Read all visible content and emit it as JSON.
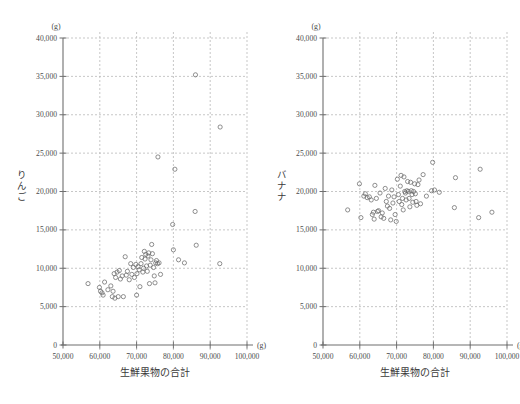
{
  "figure": {
    "background_color": "#ffffff",
    "marker_color": "#6b6b6b",
    "grid_color": "#b9b9b9",
    "axis_color": "#6f6f6f"
  },
  "charts": [
    {
      "id": "apple-scatter",
      "name": "scatter-chart-apple",
      "type": "scatter",
      "title": "",
      "xlabel": "生鮮果物の合計",
      "ylabel": "りんご",
      "ylabel_chars": [
        "り",
        "ん",
        "ご"
      ],
      "x_unit": "(g)",
      "y_unit": "(g)",
      "xlim": [
        50000,
        100000
      ],
      "ylim": [
        0,
        40000
      ],
      "x_ticks": [
        50000,
        60000,
        70000,
        80000,
        90000,
        100000
      ],
      "x_tick_labels": [
        "50,000",
        "60,000",
        "70,000",
        "80,000",
        "90,000",
        "100,000"
      ],
      "y_ticks": [
        0,
        5000,
        10000,
        15000,
        20000,
        25000,
        30000,
        35000,
        40000
      ],
      "y_tick_labels": [
        "0",
        "5,000",
        "10,000",
        "15,000",
        "20,000",
        "25,000",
        "30,000",
        "35,000",
        "40,000"
      ],
      "grid": true,
      "grid_x": [
        60000,
        70000,
        80000,
        90000,
        100000
      ],
      "grid_y": [
        5000,
        10000,
        15000,
        20000,
        25000,
        30000,
        35000,
        40000
      ],
      "legend": "none",
      "points": [
        [
          56800,
          8000
        ],
        [
          59900,
          7500
        ],
        [
          60200,
          7000
        ],
        [
          60600,
          6800
        ],
        [
          60900,
          6500
        ],
        [
          61300,
          8200
        ],
        [
          62200,
          7200
        ],
        [
          63000,
          7700
        ],
        [
          63400,
          6300
        ],
        [
          63600,
          7000
        ],
        [
          63900,
          9300
        ],
        [
          64100,
          6100
        ],
        [
          64300,
          8800
        ],
        [
          64700,
          9500
        ],
        [
          65000,
          6300
        ],
        [
          65300,
          9700
        ],
        [
          65600,
          8600
        ],
        [
          66100,
          9000
        ],
        [
          66400,
          6300
        ],
        [
          66900,
          11500
        ],
        [
          67200,
          9100
        ],
        [
          67500,
          9600
        ],
        [
          68000,
          8500
        ],
        [
          68400,
          10600
        ],
        [
          68700,
          9200
        ],
        [
          69100,
          10100
        ],
        [
          69400,
          8800
        ],
        [
          69800,
          10500
        ],
        [
          70000,
          6500
        ],
        [
          70100,
          9300
        ],
        [
          70400,
          10200
        ],
        [
          70700,
          9800
        ],
        [
          70900,
          7600
        ],
        [
          71200,
          10600
        ],
        [
          71400,
          11400
        ],
        [
          71700,
          9500
        ],
        [
          71900,
          10000
        ],
        [
          72100,
          12200
        ],
        [
          72300,
          11200
        ],
        [
          72500,
          11800
        ],
        [
          72700,
          10300
        ],
        [
          72900,
          9600
        ],
        [
          73100,
          11600
        ],
        [
          73300,
          12000
        ],
        [
          73500,
          8000
        ],
        [
          73700,
          10400
        ],
        [
          73900,
          11100
        ],
        [
          74100,
          13100
        ],
        [
          74300,
          11900
        ],
        [
          74600,
          10100
        ],
        [
          74800,
          9000
        ],
        [
          75000,
          8100
        ],
        [
          75200,
          10700
        ],
        [
          75400,
          11000
        ],
        [
          75700,
          10600
        ],
        [
          76100,
          10700
        ],
        [
          76500,
          9200
        ],
        [
          79800,
          15700
        ],
        [
          80000,
          12400
        ],
        [
          81400,
          11100
        ],
        [
          83000,
          10700
        ],
        [
          85900,
          17400
        ],
        [
          86200,
          13000
        ],
        [
          92600,
          10600
        ],
        [
          80400,
          22900
        ],
        [
          75800,
          24500
        ],
        [
          92700,
          28400
        ],
        [
          86000,
          35200
        ]
      ]
    },
    {
      "id": "banana-scatter",
      "name": "scatter-chart-banana",
      "type": "scatter",
      "title": "",
      "xlabel": "生鮮果物の合計",
      "ylabel": "バナナ",
      "ylabel_chars": [
        "バ",
        "ナ",
        "ナ"
      ],
      "x_unit": "(g)",
      "y_unit": "(g)",
      "xlim": [
        50000,
        100000
      ],
      "ylim": [
        0,
        40000
      ],
      "x_ticks": [
        50000,
        60000,
        70000,
        80000,
        90000,
        100000
      ],
      "x_tick_labels": [
        "50,000",
        "60,000",
        "70,000",
        "80,000",
        "90,000",
        "100,000"
      ],
      "y_ticks": [
        0,
        5000,
        10000,
        15000,
        20000,
        25000,
        30000,
        35000,
        40000
      ],
      "y_tick_labels": [
        "0",
        "5,000",
        "10,000",
        "15,000",
        "20,000",
        "25,000",
        "30,000",
        "35,000",
        "40,000"
      ],
      "grid": true,
      "grid_x": [
        60000,
        70000,
        80000,
        90000,
        100000
      ],
      "grid_y": [
        5000,
        10000,
        15000,
        20000,
        25000,
        30000,
        35000,
        40000
      ],
      "legend": "none",
      "points": [
        [
          56700,
          17600
        ],
        [
          59900,
          21000
        ],
        [
          60300,
          16600
        ],
        [
          61100,
          19400
        ],
        [
          61500,
          19700
        ],
        [
          62000,
          19200
        ],
        [
          62600,
          19300
        ],
        [
          63100,
          18900
        ],
        [
          63400,
          17000
        ],
        [
          63700,
          17300
        ],
        [
          63900,
          16400
        ],
        [
          64100,
          20800
        ],
        [
          64500,
          19100
        ],
        [
          64800,
          17400
        ],
        [
          65100,
          17500
        ],
        [
          65500,
          19800
        ],
        [
          65800,
          16700
        ],
        [
          66100,
          17200
        ],
        [
          66500,
          16500
        ],
        [
          66900,
          20400
        ],
        [
          67200,
          18700
        ],
        [
          67500,
          18100
        ],
        [
          67800,
          19400
        ],
        [
          68100,
          17800
        ],
        [
          68400,
          16300
        ],
        [
          68700,
          20200
        ],
        [
          69000,
          18500
        ],
        [
          69300,
          19300
        ],
        [
          69600,
          17000
        ],
        [
          69900,
          16100
        ],
        [
          70200,
          21600
        ],
        [
          70500,
          19600
        ],
        [
          70700,
          18700
        ],
        [
          71000,
          20700
        ],
        [
          71200,
          22100
        ],
        [
          71400,
          18300
        ],
        [
          71600,
          19100
        ],
        [
          71800,
          17600
        ],
        [
          72000,
          21900
        ],
        [
          72200,
          20000
        ],
        [
          72400,
          19800
        ],
        [
          72600,
          18900
        ],
        [
          72800,
          20100
        ],
        [
          73000,
          21300
        ],
        [
          73200,
          20000
        ],
        [
          73400,
          19100
        ],
        [
          73600,
          18000
        ],
        [
          73800,
          21200
        ],
        [
          74000,
          20100
        ],
        [
          74200,
          19600
        ],
        [
          74400,
          18600
        ],
        [
          74600,
          20000
        ],
        [
          74900,
          21000
        ],
        [
          75100,
          19700
        ],
        [
          75300,
          18700
        ],
        [
          75500,
          18200
        ],
        [
          75800,
          20900
        ],
        [
          76100,
          21500
        ],
        [
          76500,
          18400
        ],
        [
          77200,
          22200
        ],
        [
          78100,
          19400
        ],
        [
          79500,
          20100
        ],
        [
          79800,
          23800
        ],
        [
          80300,
          20200
        ],
        [
          81600,
          19900
        ],
        [
          85700,
          17900
        ],
        [
          86000,
          21800
        ],
        [
          92300,
          16600
        ],
        [
          92700,
          22900
        ],
        [
          95900,
          17300
        ]
      ]
    }
  ]
}
